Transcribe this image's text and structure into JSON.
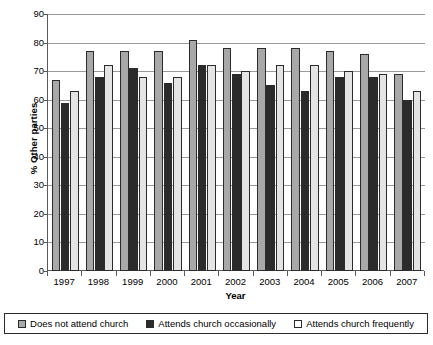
{
  "chart_data": {
    "type": "bar",
    "title": "",
    "xlabel": "Year",
    "ylabel": "% Other parties",
    "ylim": [
      0,
      90
    ],
    "ytick_step": 10,
    "yticks": [
      90,
      80,
      70,
      60,
      50,
      40,
      30,
      20,
      10,
      0
    ],
    "grid": true,
    "legend_position": "bottom",
    "categories": [
      "1997",
      "1998",
      "1999",
      "2000",
      "2001",
      "2002",
      "2003",
      "2004",
      "2005",
      "2006",
      "2007"
    ],
    "series": [
      {
        "name": "Does not attend church",
        "color": "#a8a8a8",
        "values": [
          67,
          77,
          77,
          77,
          81,
          78,
          78,
          78,
          77,
          76,
          69
        ]
      },
      {
        "name": "Attends church occasionally",
        "color": "#2b2b2b",
        "values": [
          59,
          68,
          71,
          66,
          72,
          69,
          65,
          63,
          68,
          68,
          60
        ]
      },
      {
        "name": "Attends church frequently",
        "color": "#e4e4e4",
        "values": [
          63,
          72,
          68,
          68,
          72,
          70,
          72,
          72,
          70,
          69,
          63
        ]
      }
    ]
  },
  "legend": {
    "items": [
      {
        "label": "Does not attend church",
        "swatch": "#a8a8a8"
      },
      {
        "label": "Attends church occasionally",
        "swatch": "#2b2b2b"
      },
      {
        "label": "Attends church frequently",
        "swatch": "#ffffff"
      }
    ]
  }
}
